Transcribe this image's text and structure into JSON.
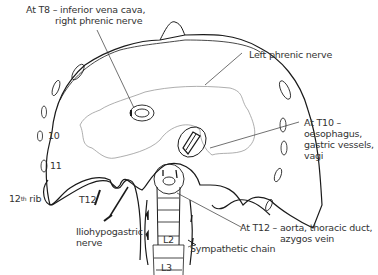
{
  "labels": {
    "t8_line1": "At T8 – inferior vena cava,",
    "t8_line2": "right phrenic nerve",
    "left_phrenic": "Left phrenic nerve",
    "t10_line1": "At T10 –",
    "t10_line2": "oesophagus,",
    "t10_line3": "gastric vessels,",
    "t10_line4": "vagi",
    "t12_line1": "At T12 – aorta, thoracic duct,",
    "t12_line2": "azygos vein",
    "sympathetic": "Sympathetic chain",
    "ilio_line1": "Iliohypogastric",
    "ilio_line2": "nerve",
    "rib10": "10",
    "rib11": "11",
    "rib12_num": "12",
    "rib12_sup": "th",
    "rib12_word": " rib",
    "t12_spine": "T12",
    "l2": "L2",
    "l3": "L3"
  },
  "colors": {
    "outline": "#1a1a1a",
    "central_tendon": "#999999",
    "text": "#333333"
  }
}
